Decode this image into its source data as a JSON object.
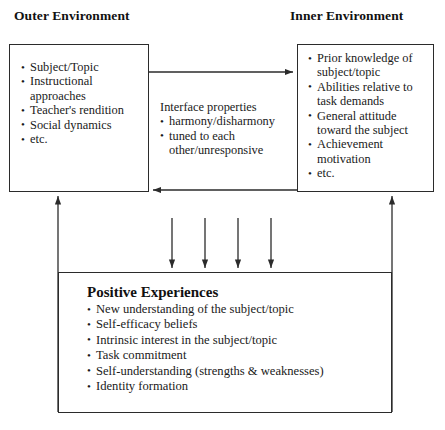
{
  "headings": {
    "outer": "Outer Environment",
    "inner": "Inner Environment"
  },
  "outer_environment": {
    "items": [
      "Subject/Topic",
      "Instructional approaches",
      "Teacher's rendition",
      "Social dynamics",
      "etc."
    ]
  },
  "inner_environment": {
    "items": [
      "Prior knowledge of subject/topic",
      "Abilities relative to task demands",
      "General attitude toward the subject",
      "Achievement motivation",
      "etc."
    ]
  },
  "interface": {
    "title": "Interface properties",
    "items": [
      "harmony/disharmony",
      "tuned to each other/unresponsive"
    ]
  },
  "outcomes": {
    "title": "Positive Experiences",
    "items": [
      "New understanding of the subject/topic",
      "Self-efficacy beliefs",
      "Intrinsic interest in the subject/topic",
      "Task commitment",
      "Self-understanding (strengths & weaknesses)",
      "Identity formation"
    ]
  },
  "colors": {
    "stroke": "#2b2b2b",
    "text": "#1a1a1a",
    "background": "#ffffff"
  }
}
